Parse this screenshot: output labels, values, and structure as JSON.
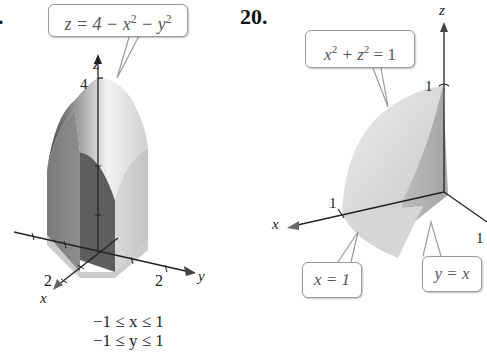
{
  "left_figure": {
    "problem_number_fragment": ".",
    "callout": {
      "lhs": "z = 4 − x",
      "exp1": "2",
      "mid": " − y",
      "exp2": "2"
    },
    "axes": {
      "z": "z",
      "x": "x",
      "y": "y"
    },
    "ticks": {
      "z_top": "4",
      "x_label": "2",
      "y_label": "2"
    },
    "constraints": [
      "−1 ≤ x ≤ 1",
      "−1 ≤ y ≤ 1"
    ]
  },
  "right_figure": {
    "problem_number": "20.",
    "callout_top": {
      "base1": "x",
      "exp1": "2",
      "mid": " + z",
      "exp2": "2",
      "rhs": " = 1"
    },
    "callout_x": "x = 1",
    "callout_yx": "y = x",
    "axes": {
      "z": "z",
      "x": "x"
    },
    "ticks": {
      "z_one": "1",
      "x_one": "1",
      "y_one": "1"
    }
  },
  "colors": {
    "solid_dark": "#5e5e5e",
    "solid_mid": "#8a8a8a",
    "solid_light": "#c8c8c8",
    "surface_light": "#e4e4e4",
    "axis": "#222222",
    "callout_border": "#9a9a9a"
  }
}
